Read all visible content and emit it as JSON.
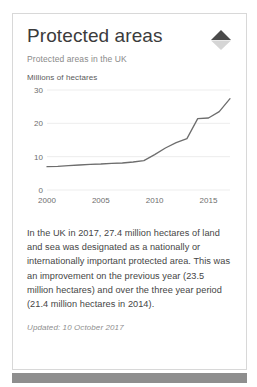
{
  "card": {
    "title": "Protected areas",
    "subtitle": "Protected areas in the UK",
    "trend_icon": "up-triangle-indicator-icon",
    "trend_direction": "up",
    "body_text": "In the UK in 2017, 27.4 million hectares of land and sea was designated as a nationally or internationally important protected area. This was an improvement on the previous year (23.5 million hectares) and over the three year period (21.4 million hectares in 2014).",
    "updated_label": "Updated: 10 October 2017"
  },
  "colors": {
    "card_border": "#d8d8d8",
    "title_text": "#3b3b3b",
    "subtitle_text": "#8a8a8a",
    "body_text": "#454545",
    "line_series": "#6d6d6d",
    "gridline": "#ededed",
    "bottom_bar": "#8e8e8e",
    "trend_up": "#4a4a4a",
    "trend_down": "#d5d5d5"
  },
  "chart_data": {
    "type": "line",
    "title": "",
    "subtitle": "",
    "xlabel": "",
    "ylabel": "Millions of hectares",
    "xlim": [
      2000,
      2017
    ],
    "ylim": [
      0,
      30
    ],
    "yticks": [
      0,
      10,
      20,
      30
    ],
    "xticks": [
      2000,
      2005,
      2010,
      2015
    ],
    "ytick_labels": [
      "0",
      "10",
      "20",
      "30"
    ],
    "xtick_labels": [
      "2000",
      "2005",
      "2010",
      "2015"
    ],
    "grid": true,
    "grid_axis": "y",
    "legend": false,
    "x": [
      2000,
      2001,
      2002,
      2003,
      2004,
      2005,
      2006,
      2007,
      2008,
      2009,
      2010,
      2011,
      2012,
      2013,
      2014,
      2015,
      2016,
      2017
    ],
    "values": [
      7.0,
      7.1,
      7.3,
      7.5,
      7.7,
      7.8,
      8.0,
      8.1,
      8.4,
      8.8,
      10.6,
      12.6,
      14.2,
      15.4,
      21.4,
      21.6,
      23.5,
      27.4
    ],
    "series": [
      {
        "name": "Protected areas",
        "values": [
          7.0,
          7.1,
          7.3,
          7.5,
          7.7,
          7.8,
          8.0,
          8.1,
          8.4,
          8.8,
          10.6,
          12.6,
          14.2,
          15.4,
          21.4,
          21.6,
          23.5,
          27.4
        ]
      }
    ]
  }
}
